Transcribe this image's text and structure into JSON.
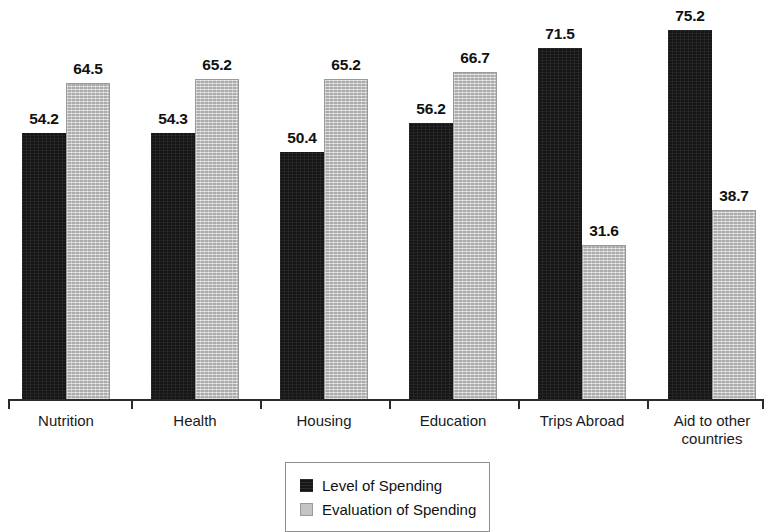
{
  "chart_data": {
    "type": "bar",
    "title": "",
    "subtitle": "",
    "xlabel": "",
    "ylabel": "",
    "ylim": [
      0,
      80
    ],
    "grid": false,
    "legend_position": "bottom-center",
    "categories": [
      "Nutrition",
      "Health",
      "Housing",
      "Education",
      "Trips Abroad",
      "Aid to other\ncountries"
    ],
    "series": [
      {
        "name": "Level of Spending",
        "color": "#161616",
        "values": [
          54.2,
          54.3,
          50.4,
          56.2,
          71.5,
          75.2
        ]
      },
      {
        "name": "Evaluation of Spending",
        "color": "#c3c3c3",
        "values": [
          64.5,
          65.2,
          65.2,
          66.7,
          31.6,
          38.7
        ]
      }
    ],
    "data_labels": [
      [
        "54.2",
        "64.5"
      ],
      [
        "54.3",
        "65.2"
      ],
      [
        "50.4",
        "65.2"
      ],
      [
        "56.2",
        "66.7"
      ],
      [
        "71.5",
        "31.6"
      ],
      [
        "75.2",
        "38.7"
      ]
    ]
  },
  "legend": {
    "items": [
      {
        "label": "Level of Spending",
        "swatch": "black-square"
      },
      {
        "label": "Evaluation of Spending",
        "swatch": "gray-square"
      }
    ]
  },
  "axis": {
    "baseline_value": "0"
  }
}
